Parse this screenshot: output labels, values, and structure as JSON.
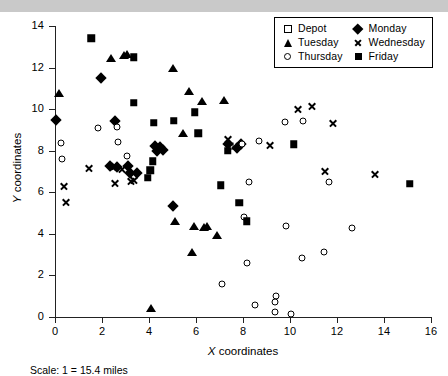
{
  "chart_data": {
    "type": "scatter",
    "title": "",
    "xlabel": "X coordinates",
    "ylabel": "Y coordinates",
    "xlim": [
      0,
      16
    ],
    "ylim": [
      0,
      14
    ],
    "xticks": [
      0,
      2,
      4,
      6,
      8,
      10,
      12,
      14,
      16
    ],
    "yticks": [
      0,
      2,
      4,
      6,
      8,
      10,
      12,
      14
    ],
    "grid": false,
    "legend_position": "top-right",
    "caption": "Scale: 1 = 15.4 miles",
    "series": [
      {
        "name": "Depot",
        "marker": "open-square",
        "points": [
          [
            7.45,
            8.25
          ]
        ]
      },
      {
        "name": "Monday",
        "marker": "filled-diamond",
        "points": [
          [
            0.05,
            9.5
          ],
          [
            1.95,
            11.5
          ],
          [
            2.55,
            9.45
          ],
          [
            2.35,
            7.25
          ],
          [
            2.65,
            7.2
          ],
          [
            3.1,
            7.25
          ],
          [
            3.2,
            6.95
          ],
          [
            3.5,
            6.95
          ],
          [
            4.25,
            8.25
          ],
          [
            4.45,
            8.2
          ],
          [
            4.6,
            8.05
          ],
          [
            4.35,
            8.0
          ],
          [
            5.0,
            5.35
          ],
          [
            7.35,
            8.3
          ],
          [
            7.75,
            8.15
          ],
          [
            7.9,
            8.3
          ]
        ]
      },
      {
        "name": "Tuesday",
        "marker": "filled-triangle",
        "points": [
          [
            0.15,
            10.8
          ],
          [
            2.4,
            12.45
          ],
          [
            2.95,
            12.6
          ],
          [
            3.05,
            12.65
          ],
          [
            5.0,
            12.0
          ],
          [
            5.7,
            10.85
          ],
          [
            6.25,
            10.4
          ],
          [
            7.2,
            10.45
          ],
          [
            5.45,
            8.85
          ],
          [
            5.1,
            4.6
          ],
          [
            5.9,
            4.4
          ],
          [
            6.35,
            4.35
          ],
          [
            6.45,
            4.4
          ],
          [
            5.85,
            3.15
          ],
          [
            6.9,
            3.95
          ],
          [
            4.1,
            0.45
          ]
        ]
      },
      {
        "name": "Wednesday",
        "marker": "cross",
        "points": [
          [
            0.4,
            6.3
          ],
          [
            1.45,
            7.15
          ],
          [
            2.45,
            7.2
          ],
          [
            2.55,
            7.25
          ],
          [
            2.85,
            7.1
          ],
          [
            3.25,
            6.55
          ],
          [
            0.45,
            5.5
          ],
          [
            2.55,
            6.45
          ],
          [
            3.35,
            6.6
          ],
          [
            9.15,
            8.25
          ],
          [
            10.35,
            10.0
          ],
          [
            10.95,
            10.15
          ],
          [
            11.85,
            9.3
          ],
          [
            11.5,
            7.0
          ],
          [
            13.6,
            6.85
          ],
          [
            7.35,
            8.55
          ]
        ]
      },
      {
        "name": "Thursday",
        "marker": "open-circle",
        "points": [
          [
            0.25,
            8.35
          ],
          [
            0.3,
            7.6
          ],
          [
            1.85,
            9.1
          ],
          [
            2.65,
            9.15
          ],
          [
            2.7,
            8.4
          ],
          [
            3.05,
            7.75
          ],
          [
            7.95,
            8.3
          ],
          [
            8.7,
            8.45
          ],
          [
            9.8,
            9.4
          ],
          [
            10.55,
            9.45
          ],
          [
            8.25,
            6.5
          ],
          [
            11.65,
            6.5
          ],
          [
            8.05,
            4.8
          ],
          [
            9.85,
            4.4
          ],
          [
            12.65,
            4.3
          ],
          [
            11.45,
            3.15
          ],
          [
            10.5,
            2.85
          ],
          [
            8.15,
            2.6
          ],
          [
            7.1,
            1.6
          ],
          [
            9.4,
            1.0
          ],
          [
            9.35,
            0.7
          ],
          [
            9.35,
            0.25
          ],
          [
            10.05,
            0.15
          ],
          [
            8.5,
            0.6
          ]
        ]
      },
      {
        "name": "Friday",
        "marker": "filled-square",
        "points": [
          [
            1.55,
            13.4
          ],
          [
            3.35,
            12.5
          ],
          [
            3.35,
            10.3
          ],
          [
            4.2,
            9.35
          ],
          [
            5.05,
            9.45
          ],
          [
            6.1,
            8.85
          ],
          [
            5.95,
            9.85
          ],
          [
            4.15,
            7.5
          ],
          [
            3.95,
            6.7
          ],
          [
            7.35,
            8.0
          ],
          [
            7.85,
            5.5
          ],
          [
            8.15,
            4.6
          ],
          [
            7.05,
            6.35
          ],
          [
            10.15,
            8.3
          ],
          [
            4.05,
            7.05
          ],
          [
            15.1,
            6.4
          ]
        ]
      }
    ]
  },
  "legend": {
    "entries": [
      {
        "label": "Depot",
        "marker": "open-square"
      },
      {
        "label": "Monday",
        "marker": "filled-diamond"
      },
      {
        "label": "Tuesday",
        "marker": "filled-triangle"
      },
      {
        "label": "Wednesday",
        "marker": "cross"
      },
      {
        "label": "Thursday",
        "marker": "open-circle"
      },
      {
        "label": "Friday",
        "marker": "filled-square"
      }
    ]
  },
  "axis": {
    "xlabel_italic": "X",
    "xlabel_rest": " coordinates",
    "ylabel_italic": "Y",
    "ylabel_rest": " coordinates"
  },
  "footer": {
    "scale_note": "Scale: 1 = 15.4 miles"
  }
}
